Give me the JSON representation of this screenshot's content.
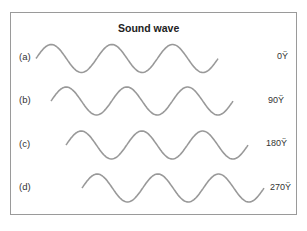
{
  "title": "Sound wave",
  "waves": [
    {
      "label": "(a)",
      "phase": "0Ÿ",
      "start_x": 36,
      "center_y": 58.5
    },
    {
      "label": "(b)",
      "phase": "90Ÿ",
      "start_x": 51,
      "center_y": 101
    },
    {
      "label": "(c)",
      "phase": "180Ÿ",
      "start_x": 66,
      "center_y": 145
    },
    {
      "label": "(d)",
      "phase": "270Ÿ",
      "start_x": 82,
      "center_y": 188
    }
  ],
  "wave_style": {
    "color": "#999999",
    "amplitude": 14,
    "period": 60.7,
    "cycles": 3
  }
}
